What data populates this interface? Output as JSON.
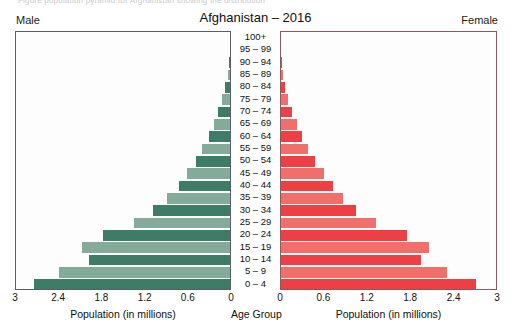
{
  "page": {
    "bleed_caption": "Figure   population pyramid for Afghanistan showing the distribution"
  },
  "header": {
    "male_label": "Male",
    "female_label": "Female",
    "title": "Afghanistan – 2016"
  },
  "axes": {
    "left_title": "Population (in millions)",
    "right_title": "Population (in millions)",
    "center_title": "Age Group",
    "left_ticks": [
      "3",
      "2.4",
      "1.8",
      "1.2",
      "0.6",
      "0"
    ],
    "right_ticks": [
      "0",
      "0.6",
      "1.2",
      "1.8",
      "2.4",
      "3"
    ]
  },
  "colors": {
    "male_dark": "#3d7d68",
    "male_light": "#84ab99",
    "female_dark": "#ee3f45",
    "female_light": "#f06f6a",
    "panel_border_left": "#5d5d66",
    "panel_border_right": "#8c5a5e",
    "text": "#111111"
  },
  "chart_data": {
    "type": "bar",
    "subtype": "population-pyramid",
    "title": "Afghanistan – 2016",
    "xlabel": "Population (in millions)",
    "ylabel": "Age Group",
    "xlim": [
      0,
      3
    ],
    "xticks": [
      0,
      0.6,
      1.2,
      1.8,
      2.4,
      3
    ],
    "grid": false,
    "legend_position": "top-corners",
    "categories": [
      "100+",
      "95 – 99",
      "90 – 94",
      "85 – 89",
      "80 – 84",
      "75 – 79",
      "70 – 74",
      "65 – 69",
      "60 – 64",
      "55 – 59",
      "50 – 54",
      "45 – 49",
      "40 – 44",
      "35 – 39",
      "30 – 34",
      "25 – 29",
      "20 – 24",
      "15 – 19",
      "10 – 14",
      "5 – 9",
      "0 – 4"
    ],
    "series": [
      {
        "name": "Male",
        "side": "left",
        "values": [
          0.0,
          0.0,
          0.01,
          0.03,
          0.07,
          0.11,
          0.17,
          0.23,
          0.3,
          0.39,
          0.48,
          0.6,
          0.72,
          0.88,
          1.08,
          1.35,
          1.78,
          2.08,
          1.97,
          2.4,
          2.75
        ]
      },
      {
        "name": "Female",
        "side": "right",
        "values": [
          0.0,
          0.0,
          0.01,
          0.03,
          0.06,
          0.1,
          0.16,
          0.22,
          0.29,
          0.38,
          0.48,
          0.6,
          0.72,
          0.86,
          1.05,
          1.33,
          1.76,
          2.06,
          1.95,
          2.32,
          2.72
        ]
      }
    ]
  }
}
